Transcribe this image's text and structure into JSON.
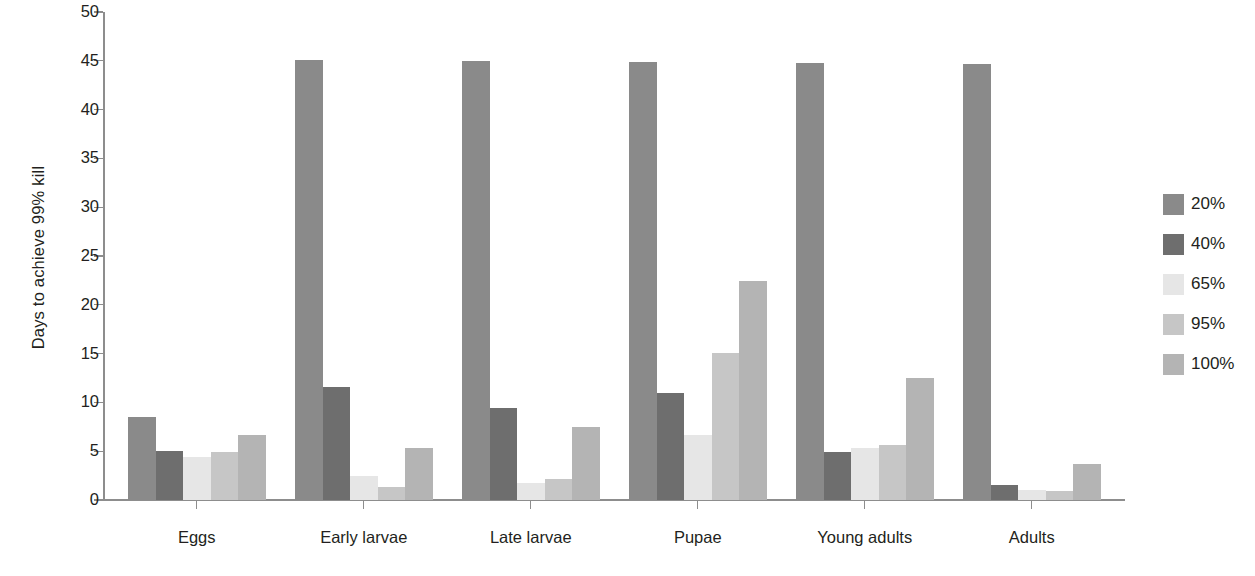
{
  "chart_data": {
    "type": "bar",
    "title": "",
    "xlabel": "",
    "ylabel": "Days to achieve 99% kill",
    "ylim": [
      0,
      50
    ],
    "ytick_step": 5,
    "yticks": [
      0,
      5,
      10,
      15,
      20,
      25,
      30,
      35,
      40,
      45,
      50
    ],
    "ytick_labels": [
      "0",
      "5",
      "10",
      "15",
      "20",
      "25",
      "30",
      "35",
      "40",
      "45",
      "50"
    ],
    "grid": false,
    "legend_position": "right",
    "categories": [
      "Eggs",
      "Early larvae",
      "Late larvae",
      "Pupae",
      "Young adults",
      "Adults"
    ],
    "series": [
      {
        "name": "20%",
        "color": "#8a8a8a",
        "values": [
          8.5,
          45.0,
          44.9,
          44.8,
          44.7,
          44.6
        ]
      },
      {
        "name": "40%",
        "color": "#6e6e6e",
        "values": [
          5.0,
          11.5,
          9.4,
          10.9,
          4.9,
          1.5
        ]
      },
      {
        "name": "65%",
        "color": "#e6e6e6",
        "values": [
          4.4,
          2.4,
          1.7,
          6.6,
          5.3,
          1.0
        ]
      },
      {
        "name": "95%",
        "color": "#c6c6c6",
        "values": [
          4.9,
          1.3,
          2.1,
          15.0,
          5.6,
          0.9
        ]
      },
      {
        "name": "100%",
        "color": "#b4b4b4",
        "values": [
          6.6,
          5.3,
          7.4,
          22.4,
          12.4,
          3.6
        ]
      }
    ]
  },
  "legend": {
    "items": [
      {
        "label": "20%",
        "color": "#8a8a8a"
      },
      {
        "label": "40%",
        "color": "#6e6e6e"
      },
      {
        "label": "65%",
        "color": "#e6e6e6"
      },
      {
        "label": "95%",
        "color": "#c6c6c6"
      },
      {
        "label": "100%",
        "color": "#b4b4b4"
      }
    ]
  },
  "axes": {
    "y_title": "Days to achieve 99% kill"
  }
}
